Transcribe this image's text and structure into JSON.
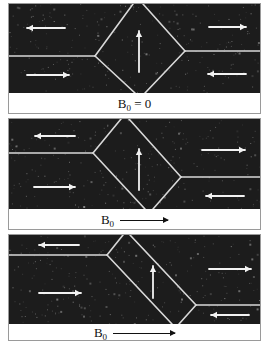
{
  "figure": {
    "panels": [
      {
        "id": "panel-1",
        "caption": {
          "symbol": "B",
          "subscript": "0",
          "relation": " = 0",
          "has_arrow": false,
          "arrow_length": 0
        },
        "frame": {
          "top": 3,
          "height": 111,
          "photo_height": 89
        },
        "walls": {
          "left_y": 52,
          "right_y": 47,
          "left_vertex_x": 86,
          "right_vertex_x": 176,
          "top_x": 124,
          "top2_x": 134,
          "bottom_x": 126,
          "bottom2_x": 136
        },
        "magnetization_arrows": [
          {
            "x1": 56,
            "y1": 24,
            "x2": 18,
            "y2": 24,
            "direction": "left"
          },
          {
            "x1": 200,
            "y1": 23,
            "x2": 237,
            "y2": 23,
            "direction": "right"
          },
          {
            "x1": 18,
            "y1": 71,
            "x2": 60,
            "y2": 71,
            "direction": "right"
          },
          {
            "x1": 237,
            "y1": 70,
            "x2": 199,
            "y2": 70,
            "direction": "left"
          },
          {
            "x1": 130,
            "y1": 68,
            "x2": 130,
            "y2": 27,
            "direction": "up"
          }
        ]
      },
      {
        "id": "panel-2",
        "caption": {
          "symbol": "B",
          "subscript": "0",
          "relation": "",
          "has_arrow": true,
          "arrow_length": 48
        },
        "frame": {
          "top": 118,
          "height": 112,
          "photo_height": 90
        },
        "walls": {
          "left_y": 34,
          "right_y": 58,
          "left_vertex_x": 84,
          "right_vertex_x": 172,
          "top_x": 112,
          "top2_x": 120,
          "bottom_x": 136,
          "bottom2_x": 144
        },
        "magnetization_arrows": [
          {
            "x1": 66,
            "y1": 17,
            "x2": 26,
            "y2": 17,
            "direction": "left"
          },
          {
            "x1": 193,
            "y1": 31,
            "x2": 236,
            "y2": 31,
            "direction": "right"
          },
          {
            "x1": 25,
            "y1": 68,
            "x2": 66,
            "y2": 68,
            "direction": "right"
          },
          {
            "x1": 235,
            "y1": 77,
            "x2": 197,
            "y2": 77,
            "direction": "left"
          },
          {
            "x1": 130,
            "y1": 71,
            "x2": 130,
            "y2": 30,
            "direction": "up"
          }
        ]
      },
      {
        "id": "panel-3",
        "caption": {
          "symbol": "B",
          "subscript": "0",
          "relation": "",
          "has_arrow": true,
          "arrow_length": 62
        },
        "frame": {
          "top": 234,
          "height": 107,
          "photo_height": 89
        },
        "walls": {
          "left_y": 20,
          "right_y": 70,
          "left_vertex_x": 98,
          "right_vertex_x": 187,
          "top_x": 114,
          "top2_x": 121,
          "bottom_x": 163,
          "bottom2_x": 170
        },
        "magnetization_arrows": [
          {
            "x1": 70,
            "y1": 10,
            "x2": 30,
            "y2": 10,
            "direction": "left"
          },
          {
            "x1": 200,
            "y1": 34,
            "x2": 242,
            "y2": 34,
            "direction": "right"
          },
          {
            "x1": 30,
            "y1": 58,
            "x2": 72,
            "y2": 58,
            "direction": "right"
          },
          {
            "x1": 240,
            "y1": 80,
            "x2": 202,
            "y2": 80,
            "direction": "left"
          },
          {
            "x1": 144,
            "y1": 63,
            "x2": 144,
            "y2": 31,
            "direction": "up"
          }
        ]
      }
    ],
    "colors": {
      "photo_bg": "#1c1c1c",
      "wall": "#d8d8d8",
      "arrow": "#f2f2f2",
      "caption_text": "#111111"
    }
  }
}
